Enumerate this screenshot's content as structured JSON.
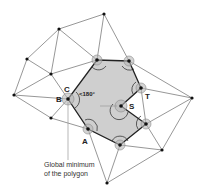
{
  "diagram": {
    "labels": {
      "A": "A",
      "B": "B",
      "C": "C",
      "S": "S",
      "T": "T",
      "angle": "<180°"
    },
    "caption": {
      "line1": "Global minimum",
      "line2": "of the polygon"
    },
    "colors": {
      "polygon_fill": "#cfcfcf",
      "polygon_stroke": "#222222",
      "edge": "#6a6a6a",
      "node": "#111111",
      "halo": "#b8b8b8"
    },
    "polygon_vertices": [
      [
        97,
        60
      ],
      [
        129,
        61
      ],
      [
        141,
        88
      ],
      [
        121,
        106
      ],
      [
        146,
        124
      ],
      [
        120,
        145
      ],
      [
        88,
        129
      ],
      [
        68,
        99
      ]
    ],
    "outer_nodes": [
      [
        104,
        14
      ],
      [
        59,
        29
      ],
      [
        27,
        59
      ],
      [
        51,
        74
      ],
      [
        14,
        95
      ],
      [
        51,
        118
      ],
      [
        192,
        98
      ],
      [
        162,
        150
      ],
      [
        107,
        183
      ]
    ]
  }
}
